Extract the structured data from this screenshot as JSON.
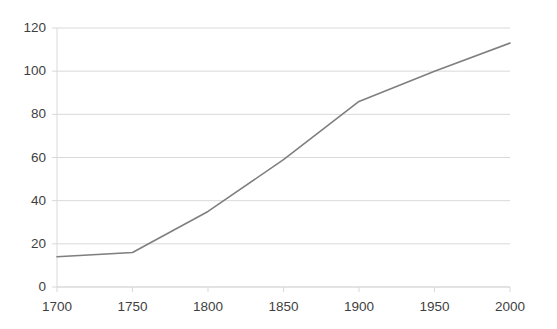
{
  "chart_data": {
    "type": "line",
    "title": "",
    "subtitle": "",
    "xlabel": "",
    "ylabel": "",
    "x": [
      1700,
      1750,
      1800,
      1850,
      1900,
      1950,
      2000
    ],
    "series": [
      {
        "name": "",
        "values": [
          14,
          16,
          35,
          59,
          86,
          100,
          113
        ],
        "color": "#7f7f7f"
      }
    ],
    "xlim": [
      1700,
      2000
    ],
    "ylim": [
      0,
      120
    ],
    "xticks": [
      1700,
      1750,
      1800,
      1850,
      1900,
      1950,
      2000
    ],
    "yticks": [
      0,
      20,
      40,
      60,
      80,
      100,
      120
    ],
    "xtick_labels": [
      "1700",
      "1750",
      "1800",
      "1850",
      "1900",
      "1950",
      "2000"
    ],
    "ytick_labels": [
      "0",
      "20",
      "40",
      "60",
      "80",
      "100",
      "120"
    ],
    "grid": {
      "horizontal": true,
      "vertical": false,
      "color": "#d9d9d9"
    },
    "legend": {
      "visible": false,
      "position": "none",
      "entries": []
    },
    "axis_color": "#d9d9d9",
    "background": "#ffffff",
    "markers": false,
    "line_width": 1.6
  },
  "layout": {
    "width": 557,
    "height": 329,
    "plot_left": 57,
    "plot_right": 510,
    "plot_top": 28,
    "plot_bottom": 287
  }
}
